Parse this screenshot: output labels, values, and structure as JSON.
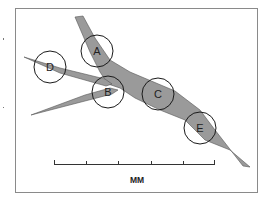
{
  "figure": {
    "type": "anatomical-region-diagram",
    "colors": {
      "shape_fill": "#9a9a9a",
      "circle_stroke": "#1a1a1a",
      "frame_stroke": "#8a8a8a"
    },
    "regions": [
      {
        "id": "A",
        "label": "A",
        "cx": 97,
        "cy": 51,
        "r": 16
      },
      {
        "id": "B",
        "label": "B",
        "cx": 108,
        "cy": 92,
        "r": 16
      },
      {
        "id": "C",
        "label": "C",
        "cx": 158,
        "cy": 94,
        "r": 16
      },
      {
        "id": "D",
        "label": "D",
        "cx": 50,
        "cy": 67,
        "r": 16
      },
      {
        "id": "E",
        "label": "E",
        "cx": 200,
        "cy": 128,
        "r": 16
      }
    ],
    "scale_bar": {
      "unit_label": "MM",
      "ticks": 6
    }
  }
}
